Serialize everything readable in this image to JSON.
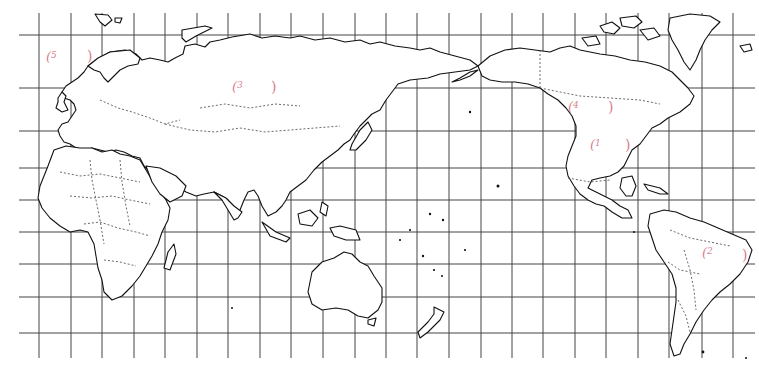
{
  "map": {
    "title": "World map (Pacific-centered) with latitude/longitude grid",
    "grid": {
      "vertical_x": [
        39,
        71,
        102,
        134,
        165,
        197,
        228,
        260,
        291,
        323,
        355,
        386,
        417,
        449,
        481,
        512,
        543,
        575,
        606,
        638,
        669,
        702,
        733
      ],
      "horizontal_y": [
        35,
        88,
        131,
        168,
        200,
        232,
        264,
        297,
        333
      ],
      "x_start": 19,
      "x_end": 755,
      "y_start": 13,
      "y_end": 358,
      "color": "#333333"
    },
    "label_color": "#d9808f",
    "labels": [
      {
        "id": "label-1",
        "open": "(",
        "number": "1",
        "close": ")",
        "x": 590,
        "y": 138,
        "close_x": 625,
        "region": "North America (central USA)"
      },
      {
        "id": "label-2",
        "open": "(",
        "number": "2",
        "close": ")",
        "x": 702,
        "y": 246,
        "close_x": 742,
        "region": "South America (Brazil)"
      },
      {
        "id": "label-3",
        "open": "(",
        "number": "3",
        "close": ")",
        "x": 232,
        "y": 80,
        "close_x": 271,
        "region": "Russia / Siberia"
      },
      {
        "id": "label-4",
        "open": "(",
        "number": "4",
        "close": ")",
        "x": 568,
        "y": 100,
        "close_x": 608,
        "region": "Canada"
      },
      {
        "id": "label-5",
        "open": "(",
        "number": "5",
        "close": ")",
        "x": 46,
        "y": 50,
        "close_x": 87,
        "region": "Northern Europe / North Atlantic"
      }
    ]
  }
}
